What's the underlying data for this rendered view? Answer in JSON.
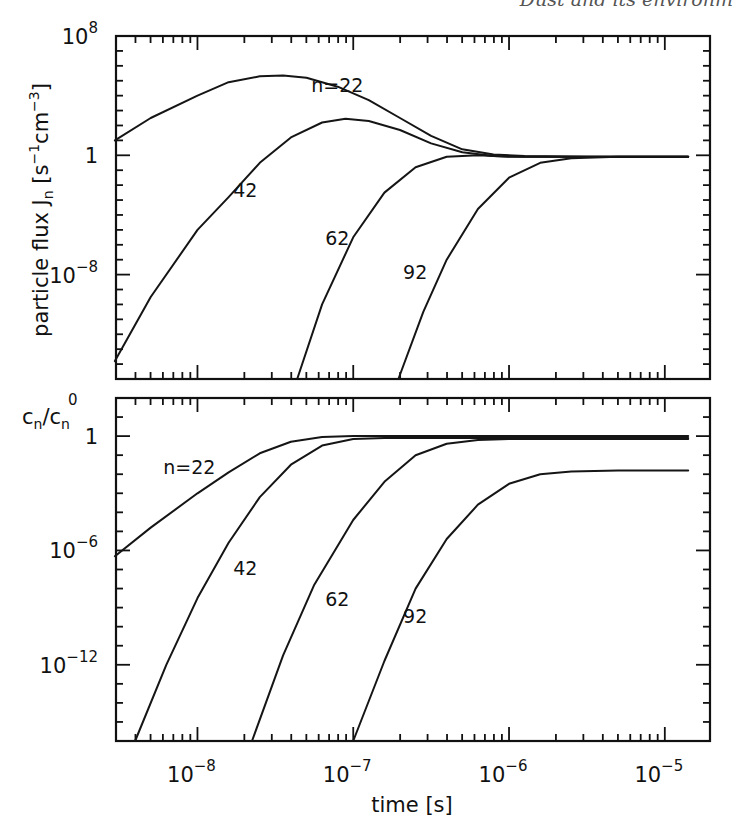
{
  "header": {
    "running_title": "Dust and its environm"
  },
  "chart_data": [
    {
      "type": "line",
      "panel": "top",
      "title": "",
      "xlabel": "time [s]",
      "ylabel": "particle flux J_n [s^-1 cm^-3]",
      "xscale": "log",
      "yscale": "log",
      "xlim": [
        3e-09,
        1.95e-05
      ],
      "ylim": [
        1e-15,
        100000000.0
      ],
      "x_ticks": [
        "10^-8",
        "10^-7",
        "10^-6",
        "10^-5"
      ],
      "y_ticks": [
        {
          "value_log10": 8,
          "label_base": "10",
          "label_exp": "8"
        },
        {
          "value_log10": 0,
          "label_base": "1",
          "label_exp": ""
        },
        {
          "value_log10": -8,
          "label_base": "10",
          "label_exp": "−8"
        }
      ],
      "grid": false,
      "legend": "inline curve labels",
      "series": [
        {
          "name": "n=22",
          "label": "n=22",
          "label_pos_log": [
            -7.27,
            4.25
          ],
          "points_log10": [
            [
              -8.53,
              1.0
            ],
            [
              -8.3,
              2.5
            ],
            [
              -8.0,
              4.0
            ],
            [
              -7.8,
              4.9
            ],
            [
              -7.6,
              5.3
            ],
            [
              -7.45,
              5.35
            ],
            [
              -7.3,
              5.2
            ],
            [
              -7.1,
              4.6
            ],
            [
              -6.9,
              3.7
            ],
            [
              -6.7,
              2.5
            ],
            [
              -6.5,
              1.3
            ],
            [
              -6.3,
              0.4
            ],
            [
              -6.1,
              0.05
            ],
            [
              -5.9,
              -0.05
            ],
            [
              -5.5,
              -0.1
            ],
            [
              -4.85,
              -0.1
            ]
          ]
        },
        {
          "name": "n=42",
          "label": "42",
          "label_pos_log": [
            -7.77,
            -2.8
          ],
          "points_log10": [
            [
              -8.53,
              -13.8
            ],
            [
              -8.3,
              -9.5
            ],
            [
              -8.0,
              -5.0
            ],
            [
              -7.8,
              -2.8
            ],
            [
              -7.6,
              -0.5
            ],
            [
              -7.4,
              1.2
            ],
            [
              -7.2,
              2.2
            ],
            [
              -7.05,
              2.45
            ],
            [
              -6.9,
              2.3
            ],
            [
              -6.7,
              1.7
            ],
            [
              -6.5,
              0.8
            ],
            [
              -6.3,
              0.2
            ],
            [
              -6.1,
              -0.05
            ],
            [
              -5.9,
              -0.1
            ],
            [
              -4.85,
              -0.1
            ]
          ]
        },
        {
          "name": "n=62",
          "label": "62",
          "label_pos_log": [
            -7.18,
            -6.0
          ],
          "points_log10": [
            [
              -7.36,
              -15.0
            ],
            [
              -7.2,
              -10.0
            ],
            [
              -7.0,
              -5.5
            ],
            [
              -6.8,
              -2.5
            ],
            [
              -6.6,
              -0.8
            ],
            [
              -6.4,
              -0.1
            ],
            [
              -6.2,
              0.0
            ],
            [
              -6.0,
              -0.1
            ],
            [
              -5.8,
              -0.1
            ],
            [
              -4.85,
              -0.1
            ]
          ]
        },
        {
          "name": "n=92",
          "label": "92",
          "label_pos_log": [
            -6.68,
            -8.3
          ],
          "points_log10": [
            [
              -6.71,
              -15.0
            ],
            [
              -6.55,
              -10.5
            ],
            [
              -6.4,
              -7.0
            ],
            [
              -6.2,
              -3.6
            ],
            [
              -6.0,
              -1.5
            ],
            [
              -5.8,
              -0.5
            ],
            [
              -5.6,
              -0.2
            ],
            [
              -5.3,
              -0.1
            ],
            [
              -4.85,
              -0.1
            ]
          ]
        }
      ]
    },
    {
      "type": "line",
      "panel": "bottom",
      "title": "",
      "xlabel": "time [s]",
      "ylabel": "c_n/c_n^0",
      "xscale": "log",
      "yscale": "log",
      "xlim": [
        3e-09,
        1.95e-05
      ],
      "ylim": [
        1e-16,
        100.0
      ],
      "x_ticks": [
        "10^-8",
        "10^-7",
        "10^-6",
        "10^-5"
      ],
      "y_ticks": [
        {
          "value_log10": 0,
          "label_base": "1",
          "label_exp": ""
        },
        {
          "value_log10": -6,
          "label_base": "10",
          "label_exp": "−6"
        },
        {
          "value_log10": -12,
          "label_base": "10",
          "label_exp": "−12"
        }
      ],
      "grid": false,
      "legend": "inline curve labels",
      "series": [
        {
          "name": "n=22",
          "label": "n=22",
          "label_pos_log": [
            -8.22,
            -2.0
          ],
          "points_log10": [
            [
              -8.53,
              -6.3
            ],
            [
              -8.3,
              -4.8
            ],
            [
              -8.0,
              -3.0
            ],
            [
              -7.8,
              -1.9
            ],
            [
              -7.6,
              -0.9
            ],
            [
              -7.4,
              -0.3
            ],
            [
              -7.2,
              -0.05
            ],
            [
              -7.0,
              0.0
            ],
            [
              -6.5,
              0.0
            ],
            [
              -4.85,
              0.0
            ]
          ]
        },
        {
          "name": "n=42",
          "label": "42",
          "label_pos_log": [
            -7.77,
            -7.3
          ],
          "points_log10": [
            [
              -8.4,
              -16.0
            ],
            [
              -8.2,
              -12.0
            ],
            [
              -8.0,
              -8.5
            ],
            [
              -7.8,
              -5.6
            ],
            [
              -7.6,
              -3.2
            ],
            [
              -7.4,
              -1.5
            ],
            [
              -7.2,
              -0.5
            ],
            [
              -7.0,
              -0.15
            ],
            [
              -6.8,
              -0.1
            ],
            [
              -4.85,
              -0.1
            ]
          ]
        },
        {
          "name": "n=62",
          "label": "62",
          "label_pos_log": [
            -7.18,
            -8.9
          ],
          "points_log10": [
            [
              -7.65,
              -16.0
            ],
            [
              -7.45,
              -11.5
            ],
            [
              -7.25,
              -7.8
            ],
            [
              -7.0,
              -4.4
            ],
            [
              -6.8,
              -2.4
            ],
            [
              -6.6,
              -1.0
            ],
            [
              -6.4,
              -0.4
            ],
            [
              -6.2,
              -0.2
            ],
            [
              -6.0,
              -0.15
            ],
            [
              -4.85,
              -0.15
            ]
          ]
        },
        {
          "name": "n=92",
          "label": "92",
          "label_pos_log": [
            -6.68,
            -9.8
          ],
          "points_log10": [
            [
              -7.0,
              -16.0
            ],
            [
              -6.8,
              -11.8
            ],
            [
              -6.6,
              -8.0
            ],
            [
              -6.4,
              -5.4
            ],
            [
              -6.2,
              -3.6
            ],
            [
              -6.0,
              -2.5
            ],
            [
              -5.8,
              -2.0
            ],
            [
              -5.6,
              -1.85
            ],
            [
              -5.3,
              -1.8
            ],
            [
              -4.85,
              -1.8
            ]
          ]
        }
      ]
    }
  ]
}
